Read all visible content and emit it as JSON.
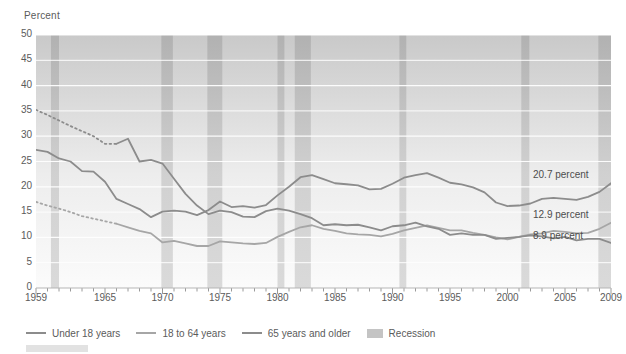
{
  "chart_data": {
    "type": "line",
    "title": "",
    "ylabel": "Percent",
    "xlabel": "",
    "ylim": [
      0,
      50
    ],
    "xlim": [
      1959,
      2009
    ],
    "yticks": [
      0,
      5,
      10,
      15,
      20,
      25,
      30,
      35,
      40,
      45,
      50
    ],
    "xticks": [
      1959,
      1965,
      1970,
      1975,
      1980,
      1985,
      1990,
      1995,
      2000,
      2005,
      2009
    ],
    "grid": "horizontal",
    "legend_position": "below",
    "series": [
      {
        "name": "Under 18 years",
        "color": "#8c8c8c",
        "x": [
          1959,
          1960,
          1961,
          1962,
          1963,
          1964,
          1965,
          1966,
          1967,
          1968,
          1969,
          1970,
          1971,
          1972,
          1973,
          1974,
          1975,
          1976,
          1977,
          1978,
          1979,
          1980,
          1981,
          1982,
          1983,
          1984,
          1985,
          1986,
          1987,
          1988,
          1989,
          1990,
          1991,
          1992,
          1993,
          1994,
          1995,
          1996,
          1997,
          1998,
          1999,
          2000,
          2001,
          2002,
          2003,
          2004,
          2005,
          2006,
          2007,
          2008,
          2009
        ],
        "values": [
          27.3,
          26.9,
          25.6,
          25.0,
          23.1,
          23.0,
          21.0,
          17.6,
          16.6,
          15.6,
          14.0,
          15.1,
          15.3,
          15.1,
          14.4,
          15.4,
          17.1,
          16.0,
          16.2,
          15.9,
          16.4,
          18.3,
          20.0,
          21.9,
          22.3,
          21.5,
          20.7,
          20.5,
          20.3,
          19.5,
          19.6,
          20.6,
          21.8,
          22.3,
          22.7,
          21.8,
          20.8,
          20.5,
          19.9,
          18.9,
          16.9,
          16.2,
          16.3,
          16.7,
          17.6,
          17.8,
          17.6,
          17.4,
          18.0,
          19.0,
          20.7
        ]
      },
      {
        "name": "18 to 64 years",
        "color": "#a6a6a6",
        "dashed_start": true,
        "x": [
          1959,
          1960,
          1961,
          1962,
          1963,
          1964,
          1965,
          1966,
          1967,
          1968,
          1969,
          1970,
          1971,
          1972,
          1973,
          1974,
          1975,
          1976,
          1977,
          1978,
          1979,
          1980,
          1981,
          1982,
          1983,
          1984,
          1985,
          1986,
          1987,
          1988,
          1989,
          1990,
          1991,
          1992,
          1993,
          1994,
          1995,
          1996,
          1997,
          1998,
          1999,
          2000,
          2001,
          2002,
          2003,
          2004,
          2005,
          2006,
          2007,
          2008,
          2009
        ],
        "values": [
          17.0,
          16.3,
          15.7,
          15.0,
          14.2,
          13.7,
          13.2,
          12.7,
          12.0,
          11.3,
          10.8,
          9.0,
          9.3,
          8.8,
          8.3,
          8.3,
          9.2,
          9.0,
          8.8,
          8.7,
          8.9,
          10.1,
          11.1,
          12.0,
          12.4,
          11.7,
          11.3,
          10.8,
          10.6,
          10.5,
          10.2,
          10.7,
          11.4,
          11.9,
          12.4,
          11.9,
          11.4,
          11.4,
          10.9,
          10.5,
          10.0,
          9.6,
          10.1,
          10.6,
          10.8,
          11.3,
          11.1,
          10.8,
          10.9,
          11.7,
          12.9
        ]
      },
      {
        "name": "65 years and older",
        "color": "#8c8c8c",
        "dashed_start": true,
        "x": [
          1959,
          1960,
          1961,
          1962,
          1963,
          1964,
          1965,
          1966,
          1967,
          1968,
          1969,
          1970,
          1971,
          1972,
          1973,
          1974,
          1975,
          1976,
          1977,
          1978,
          1979,
          1980,
          1981,
          1982,
          1983,
          1984,
          1985,
          1986,
          1987,
          1988,
          1989,
          1990,
          1991,
          1992,
          1993,
          1994,
          1995,
          1996,
          1997,
          1998,
          1999,
          2000,
          2001,
          2002,
          2003,
          2004,
          2005,
          2006,
          2007,
          2008,
          2009
        ],
        "values": [
          35.2,
          34.2,
          33.1,
          32.0,
          31.0,
          30.0,
          28.5,
          28.5,
          29.5,
          25.0,
          25.3,
          24.6,
          21.6,
          18.6,
          16.3,
          14.6,
          15.3,
          15.0,
          14.1,
          14.0,
          15.2,
          15.7,
          15.3,
          14.6,
          13.8,
          12.4,
          12.6,
          12.4,
          12.5,
          12.0,
          11.4,
          12.2,
          12.4,
          12.9,
          12.2,
          11.7,
          10.5,
          10.8,
          10.5,
          10.5,
          9.7,
          9.9,
          10.1,
          10.4,
          10.2,
          9.8,
          10.1,
          9.4,
          9.7,
          9.7,
          8.9
        ]
      }
    ],
    "annotations": [
      {
        "text": "20.7 percent",
        "series": "Under 18 years",
        "x": 2009,
        "y": 20.7
      },
      {
        "text": "12.9 percent",
        "series": "18 to 64 years",
        "x": 2009,
        "y": 12.9
      },
      {
        "text": "8.9 percent",
        "series": "65 years and older",
        "x": 2009,
        "y": 8.9
      }
    ],
    "recessions": [
      {
        "label": "Recession",
        "start": 1960.3,
        "end": 1961.0
      },
      {
        "label": "Recession",
        "start": 1969.9,
        "end": 1970.9
      },
      {
        "label": "Recession",
        "start": 1973.9,
        "end": 1975.2
      },
      {
        "label": "Recession",
        "start": 1980.0,
        "end": 1980.6
      },
      {
        "label": "Recession",
        "start": 1981.5,
        "end": 1982.9
      },
      {
        "label": "Recession",
        "start": 1990.6,
        "end": 1991.2
      },
      {
        "label": "Recession",
        "start": 2001.2,
        "end": 2001.9
      },
      {
        "label": "Recession",
        "start": 2007.9,
        "end": 2009.4
      }
    ]
  },
  "legend": {
    "items": [
      {
        "label": "Under 18 years",
        "type": "line",
        "color": "#8c8c8c"
      },
      {
        "label": "18 to 64 years",
        "type": "line",
        "color": "#a6a6a6"
      },
      {
        "label": "65 years and older",
        "type": "line",
        "color": "#8c8c8c"
      },
      {
        "label": "Recession",
        "type": "swatch",
        "color": "#c4c4c4"
      }
    ]
  },
  "colors": {
    "recession_band": "#c6c6c6",
    "grid": "#ffffff",
    "text": "#5b5b5b",
    "plot_bg_top": "#c9c9c9",
    "plot_bg_bottom": "#fbfbfb"
  }
}
